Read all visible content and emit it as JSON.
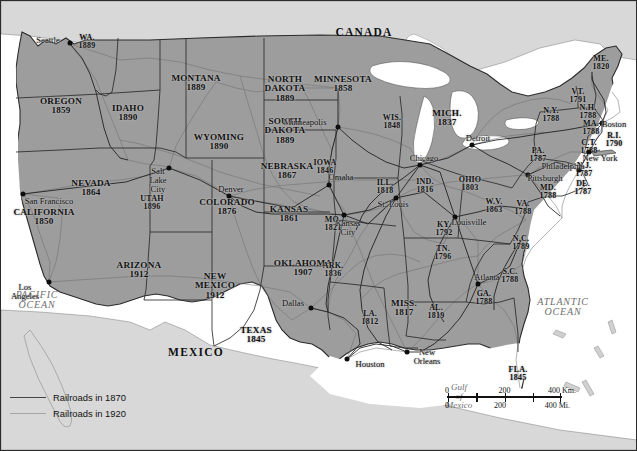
{
  "map": {
    "title": "Railroads in 1870 and 1920",
    "countries": [
      {
        "name": "CANADA",
        "x": 364,
        "y": 33
      },
      {
        "name": "MEXICO",
        "x": 196,
        "y": 353
      }
    ],
    "oceans": [
      {
        "name_line1": "PACIFIC",
        "name_line2": "OCEAN",
        "x": 37,
        "y": 300
      },
      {
        "name_line1": "ATLANTIC",
        "name_line2": "OCEAN",
        "x": 563,
        "y": 307
      },
      {
        "name_line1": "Gulf",
        "name_line2": "of",
        "name_line3": "Mexico",
        "x": 459,
        "y": 397
      }
    ],
    "states": [
      {
        "name": "WA.",
        "year": "1889",
        "x": 87,
        "y": 42
      },
      {
        "name": "OREGON",
        "year": "1859",
        "x": 61,
        "y": 106
      },
      {
        "name": "IDAHO",
        "year": "1890",
        "x": 128,
        "y": 113
      },
      {
        "name": "MONTANA",
        "year": "1889",
        "x": 196,
        "y": 83
      },
      {
        "name": "WYOMING",
        "year": "1890",
        "x": 219,
        "y": 142
      },
      {
        "name": "NEVADA",
        "year": "1864",
        "x": 91,
        "y": 188
      },
      {
        "name": "UTAH",
        "year": "1896",
        "x": 152,
        "y": 203
      },
      {
        "name": "CALIFORNIA",
        "year": "1850",
        "x": 44,
        "y": 217
      },
      {
        "name": "ARIZONA",
        "year": "1912",
        "x": 139,
        "y": 270
      },
      {
        "name": "NEW MEXICO",
        "year": "1912",
        "x": 215,
        "y": 286
      },
      {
        "name": "COLORADO",
        "year": "1876",
        "x": 227,
        "y": 207
      },
      {
        "name": "NORTH DAKOTA",
        "year": "1889",
        "x": 285,
        "y": 89
      },
      {
        "name": "SOUTH DAKOTA",
        "year": "1889",
        "x": 285,
        "y": 131
      },
      {
        "name": "NEBRASKA",
        "year": "1867",
        "x": 287,
        "y": 171
      },
      {
        "name": "KANSAS",
        "year": "1861",
        "x": 289,
        "y": 214
      },
      {
        "name": "OKLAHOMA",
        "year": "1907",
        "x": 303,
        "y": 268
      },
      {
        "name": "TEXAS",
        "year": "1845",
        "x": 256,
        "y": 335
      },
      {
        "name": "MINNESOTA",
        "year": "1858",
        "x": 343,
        "y": 84
      },
      {
        "name": "IOWA",
        "year": "1846",
        "x": 325,
        "y": 167
      },
      {
        "name": "MO.",
        "year": "1821",
        "x": 333,
        "y": 224
      },
      {
        "name": "ARK.",
        "year": "1836",
        "x": 333,
        "y": 270
      },
      {
        "name": "LA.",
        "year": "1812",
        "x": 370,
        "y": 318
      },
      {
        "name": "WIS.",
        "year": "1848",
        "x": 392,
        "y": 122
      },
      {
        "name": "ILL.",
        "year": "1818",
        "x": 385,
        "y": 187
      },
      {
        "name": "MISS.",
        "year": "1817",
        "x": 404,
        "y": 308
      },
      {
        "name": "MICH.",
        "year": "1837",
        "x": 447,
        "y": 118
      },
      {
        "name": "IND.",
        "year": "1816",
        "x": 425,
        "y": 186
      },
      {
        "name": "OHIO",
        "year": "1803",
        "x": 470,
        "y": 184
      },
      {
        "name": "KY.",
        "year": "1792",
        "x": 444,
        "y": 229
      },
      {
        "name": "TN.",
        "year": "1796",
        "x": 443,
        "y": 253
      },
      {
        "name": "AL.",
        "year": "1819",
        "x": 436,
        "y": 312
      },
      {
        "name": "GA.",
        "year": "1788",
        "x": 484,
        "y": 298
      },
      {
        "name": "FLA.",
        "year": "1845",
        "x": 518,
        "y": 374
      },
      {
        "name": "S.C.",
        "year": "1788",
        "x": 510,
        "y": 276
      },
      {
        "name": "N.C.",
        "year": "1789",
        "x": 521,
        "y": 243
      },
      {
        "name": "W.V.",
        "year": "1863",
        "x": 494,
        "y": 206
      },
      {
        "name": "VA.",
        "year": "1788",
        "x": 523,
        "y": 208
      },
      {
        "name": "MD.",
        "year": "1788",
        "x": 548,
        "y": 192
      },
      {
        "name": "DE.",
        "year": "1787",
        "x": 583,
        "y": 188
      },
      {
        "name": "N.J.",
        "year": "1787",
        "x": 584,
        "y": 170
      },
      {
        "name": "PA.",
        "year": "1787",
        "x": 538,
        "y": 155
      },
      {
        "name": "N.Y.",
        "year": "1788",
        "x": 551,
        "y": 115
      },
      {
        "name": "VT.",
        "year": "1791",
        "x": 578,
        "y": 96
      },
      {
        "name": "N.H.",
        "year": "1788",
        "x": 588,
        "y": 112
      },
      {
        "name": "MA.",
        "year": "1788",
        "x": 591,
        "y": 128
      },
      {
        "name": "C.T.",
        "year": "1788",
        "x": 589,
        "y": 147
      },
      {
        "name": "R.I.",
        "year": "1790",
        "x": 614,
        "y": 140
      },
      {
        "name": "ME.",
        "year": "1820",
        "x": 601,
        "y": 63
      }
    ],
    "cities": [
      {
        "name": "Seattle",
        "x": 48,
        "y": 40,
        "dot_x": 70,
        "dot_y": 43,
        "align": "right"
      },
      {
        "name": "San Francisco",
        "x": 49,
        "y": 201,
        "dot_x": 23,
        "dot_y": 194,
        "align": "left"
      },
      {
        "name": "Los Angeles",
        "x": 25,
        "y": 292,
        "dot_x": 49,
        "dot_y": 282,
        "align": "center"
      },
      {
        "name": "Salt Lake City",
        "x": 158,
        "y": 180,
        "dot_x": 169,
        "dot_y": 168,
        "align": "center"
      },
      {
        "name": "Denver",
        "x": 231,
        "y": 189,
        "dot_x": 229,
        "dot_y": 196,
        "align": "center"
      },
      {
        "name": "Minneapolis",
        "x": 305,
        "y": 122,
        "dot_x": 338,
        "dot_y": 127,
        "align": "left"
      },
      {
        "name": "Omaha",
        "x": 341,
        "y": 177,
        "dot_x": 329,
        "dot_y": 185,
        "align": "center"
      },
      {
        "name": "Kansas City",
        "x": 348,
        "y": 228,
        "dot_x": 344,
        "dot_y": 215,
        "align": "center"
      },
      {
        "name": "Chicago",
        "x": 424,
        "y": 158,
        "dot_x": 420,
        "dot_y": 165,
        "align": "center"
      },
      {
        "name": "St. Louis",
        "x": 393,
        "y": 204,
        "dot_x": 396,
        "dot_y": 198,
        "align": "center"
      },
      {
        "name": "Detroit",
        "x": 478,
        "y": 138,
        "dot_x": 472,
        "dot_y": 145,
        "align": "center"
      },
      {
        "name": "Louisville",
        "x": 469,
        "y": 222,
        "dot_x": 455,
        "dot_y": 217,
        "align": "center"
      },
      {
        "name": "Atlanta",
        "x": 487,
        "y": 277,
        "dot_x": 478,
        "dot_y": 284,
        "align": "center"
      },
      {
        "name": "Dallas",
        "x": 293,
        "y": 303,
        "dot_x": 311,
        "dot_y": 308,
        "align": "center"
      },
      {
        "name": "Houston",
        "x": 370,
        "y": 364,
        "dot_x": 347,
        "dot_y": 359,
        "align": "center"
      },
      {
        "name": "New Orleans",
        "x": 427,
        "y": 357,
        "dot_x": 407,
        "dot_y": 352,
        "align": "center"
      },
      {
        "name": "Philadelphia",
        "x": 563,
        "y": 166,
        "dot_x": 579,
        "dot_y": 170,
        "align": "center"
      },
      {
        "name": "Pittsburgh",
        "x": 545,
        "y": 178,
        "dot_x": 528,
        "dot_y": 175,
        "align": "center"
      },
      {
        "name": "New York",
        "x": 600,
        "y": 158,
        "dot_x": 589,
        "dot_y": 152,
        "align": "center"
      },
      {
        "name": "Boston",
        "x": 614,
        "y": 124,
        "dot_x": 602,
        "dot_y": 123,
        "align": "center"
      }
    ]
  },
  "legend": {
    "items": [
      {
        "label": "Railroads in 1870",
        "color": "#444444"
      },
      {
        "label": "Railroads in 1920",
        "color": "#a6a6a6"
      }
    ]
  },
  "scale": {
    "km": {
      "ticks": [
        "0",
        "200",
        "400 Km."
      ]
    },
    "mi": {
      "ticks": [
        "0",
        "200",
        "400 Mi."
      ]
    }
  },
  "colors": {
    "land_us": "#9d9d9d",
    "land_other": "#d8d8d8",
    "water": "#ffffff",
    "rail_1870": "#1a1a1a",
    "rail_1920": "#6e6e6e",
    "border": "#2b2b2b"
  }
}
